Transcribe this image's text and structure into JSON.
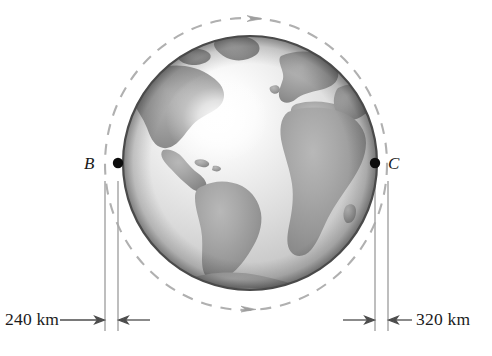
{
  "figure": {
    "type": "orbital-mechanics-diagram",
    "background_color": "#ffffff"
  },
  "earth": {
    "name": "earth-globe",
    "center": {
      "x": 250,
      "y": 163
    },
    "radius": 127,
    "shading": "grayscale-sphere-with-specular-highlight",
    "highlight": {
      "x": 218,
      "y": 118
    },
    "ocean_color": "#d2d2d2",
    "land_color": "#9a9a9a",
    "outline_color": "#4a4a4a",
    "visible_landmasses": [
      "North America",
      "South America",
      "Greenland",
      "Europe",
      "Africa",
      "Western Asia",
      "Antarctica"
    ]
  },
  "orbit": {
    "name": "dashed-elliptical-orbit",
    "center": {
      "x": 246,
      "y": 164
    },
    "semi_major_x": 141,
    "semi_minor_y": 146,
    "stroke_color": "#b0b0b0",
    "dash_pattern": "11 9",
    "direction": "counterclockwise-in-figure-rightward-at-top",
    "arrow_markers": [
      {
        "name": "orbit-arrow-top",
        "x": 256,
        "y": 19,
        "points": "right"
      },
      {
        "name": "orbit-arrow-bottom",
        "x": 250,
        "y": 309,
        "points": "right"
      }
    ]
  },
  "points": [
    {
      "id": "B",
      "label": "B",
      "label_side": "left",
      "dot": {
        "x": 118,
        "y": 163
      },
      "dot_color": "#0d0d0d"
    },
    {
      "id": "C",
      "label": "C",
      "label_side": "right",
      "dot": {
        "x": 375,
        "y": 163
      },
      "dot_color": "#0d0d0d"
    }
  ],
  "reference_lines": {
    "name": "vertical-reference-lines",
    "stroke_color": "#a8a8a8",
    "y_top": 180,
    "y_bottom": 331,
    "x_positions": [
      105,
      118,
      375,
      388
    ]
  },
  "dimensions": [
    {
      "id": "left-altitude",
      "value": "240 km",
      "magnitude": 240,
      "unit": "km",
      "label_side": "left",
      "measures_between_x": [
        105,
        118
      ],
      "baseline_y": 320,
      "arrow_in_from_left": true,
      "arrow_in_from_right": true
    },
    {
      "id": "right-altitude",
      "value": "320 km",
      "magnitude": 320,
      "unit": "km",
      "label_side": "right",
      "measures_between_x": [
        375,
        388
      ],
      "baseline_y": 320,
      "arrow_in_from_left": true,
      "arrow_in_from_right": true
    }
  ],
  "caption": {
    "text": "",
    "note": "cropped-at-bottom-edge"
  },
  "colors": {
    "ink": "#1b1b1b",
    "dot": "#0d0d0d",
    "orbit_dash": "#b0b0b0",
    "reference_line": "#a8a8a8",
    "arrow": "#4d4d4d"
  }
}
